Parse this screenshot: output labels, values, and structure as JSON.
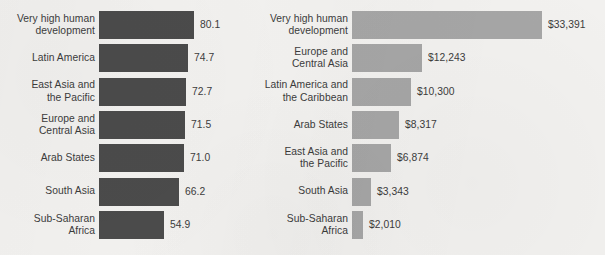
{
  "figure": {
    "background_color": "#f2f1ef",
    "text_color": "#3c3c3c"
  },
  "chart_data": [
    {
      "type": "bar",
      "orientation": "horizontal",
      "id": "life-expectancy",
      "title": "",
      "xlabel": "",
      "ylabel": "",
      "bar_color": "#4b4b4b",
      "grid": false,
      "legend": "none",
      "value_format": "one-decimal",
      "xlim": [
        45,
        82
      ],
      "categories": [
        "Very high human\ndevelopment",
        "Latin America",
        "East Asia and\nthe Pacific",
        "Europe and\nCentral Asia",
        "Arab States",
        "South Asia",
        "Sub-Saharan\nAfrica"
      ],
      "values": [
        80.1,
        74.7,
        72.7,
        71.5,
        71.0,
        66.2,
        54.9
      ],
      "value_labels": [
        "80.1",
        "74.7",
        "72.7",
        "71.5",
        "71.0",
        "66.2",
        "54.9"
      ],
      "bar_pixel_widths": [
        95,
        89,
        87,
        86,
        85,
        80,
        65
      ]
    },
    {
      "type": "bar",
      "orientation": "horizontal",
      "id": "gross-national-income-per-capita",
      "title": "",
      "xlabel": "",
      "ylabel": "",
      "bar_color": "#a6a6a6",
      "grid": false,
      "legend": "none",
      "value_format": "dollars-thousands-separated",
      "xlim": [
        0,
        33391
      ],
      "categories": [
        "Very high human\ndevelopment",
        "Europe and\nCentral Asia",
        "Latin America and\nthe Caribbean",
        "Arab States",
        "East Asia and\nthe Pacific",
        "South Asia",
        "Sub-Saharan\nAfrica"
      ],
      "values": [
        33391,
        12243,
        10300,
        8317,
        6874,
        3343,
        2010
      ],
      "value_labels": [
        "$33,391",
        "$12,243",
        "$10,300",
        "$8,317",
        "$6,874",
        "$3,343",
        "$2,010"
      ],
      "bar_pixel_widths": [
        190,
        70,
        59,
        47,
        39,
        19,
        11
      ]
    }
  ]
}
